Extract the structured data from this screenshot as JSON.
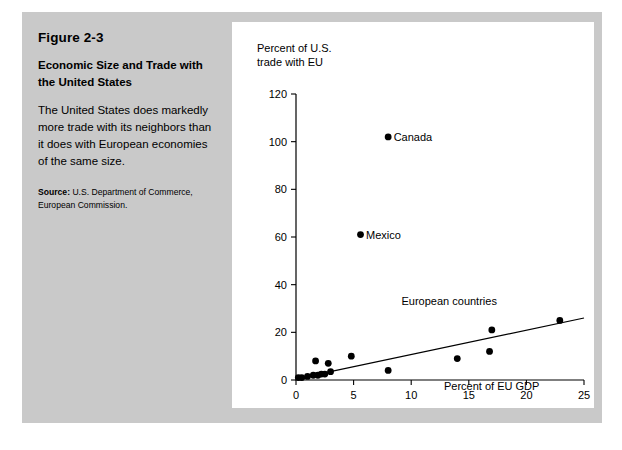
{
  "figure": {
    "number": "Figure 2-3",
    "title": "Economic Size and Trade with the United States",
    "description": "The United States does markedly more trade with its neighbors than it does with European economies of the same size.",
    "source_label": "Source:",
    "source_text": " U.S. Department of Commerce, European Commission."
  },
  "colors": {
    "panel_background": "#c9c9c9",
    "chart_background": "#ffffff",
    "ink": "#000000"
  },
  "chart_data": {
    "type": "scatter",
    "title": "",
    "xlabel": "Percent of EU GDP",
    "ylabel": "Percent of U.S.\ntrade with EU",
    "xlim": [
      0,
      25
    ],
    "ylim": [
      0,
      120
    ],
    "xticks": [
      0,
      5,
      10,
      15,
      20,
      25
    ],
    "yticks": [
      0,
      20,
      40,
      60,
      80,
      100,
      120
    ],
    "xticklabels": [
      "0",
      "5",
      "10",
      "15",
      "20",
      "25"
    ],
    "yticklabels": [
      "0",
      "20",
      "40",
      "60",
      "80",
      "100",
      "120"
    ],
    "grid": false,
    "legend": false,
    "points": [
      {
        "x": 8.0,
        "y": 102,
        "label": "Canada"
      },
      {
        "x": 5.6,
        "y": 61,
        "label": "Mexico"
      },
      {
        "x": 0.2,
        "y": 1,
        "label": ""
      },
      {
        "x": 0.5,
        "y": 1,
        "label": ""
      },
      {
        "x": 1.0,
        "y": 1.5,
        "label": ""
      },
      {
        "x": 1.5,
        "y": 2,
        "label": ""
      },
      {
        "x": 1.7,
        "y": 8,
        "label": ""
      },
      {
        "x": 1.9,
        "y": 2,
        "label": ""
      },
      {
        "x": 2.2,
        "y": 2.5,
        "label": ""
      },
      {
        "x": 2.5,
        "y": 2.5,
        "label": ""
      },
      {
        "x": 2.8,
        "y": 7,
        "label": ""
      },
      {
        "x": 3.0,
        "y": 3.5,
        "label": ""
      },
      {
        "x": 4.8,
        "y": 10,
        "label": ""
      },
      {
        "x": 8.0,
        "y": 4,
        "label": ""
      },
      {
        "x": 14.0,
        "y": 9,
        "label": ""
      },
      {
        "x": 16.8,
        "y": 12,
        "label": ""
      },
      {
        "x": 17.0,
        "y": 21,
        "label": ""
      },
      {
        "x": 22.9,
        "y": 25,
        "label": ""
      }
    ],
    "trend_line": {
      "x1": 0,
      "y1": 0.5,
      "x2": 25,
      "y2": 26
    },
    "annotations": [
      {
        "text": "European countries",
        "x": 13.3,
        "y": 31.5
      }
    ]
  }
}
